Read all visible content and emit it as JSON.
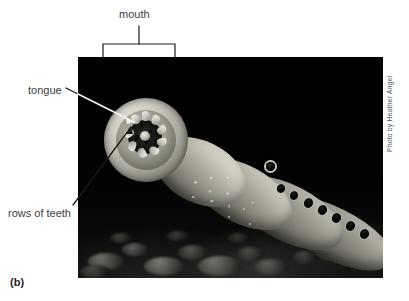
{
  "figure": {
    "letter": "(b)",
    "photo_credit": "Photo by Heather Angel"
  },
  "labels": {
    "mouth": "mouth",
    "tongue": "tongue",
    "rows_of_teeth": "rows of teeth"
  },
  "callouts": [
    {
      "name": "mouth",
      "text": "mouth",
      "style": "bracket",
      "bracket_left_x": 103,
      "bracket_right_x": 175,
      "bracket_top_y": 44,
      "bracket_bottom_y": 57,
      "stem_x": 139,
      "stem_top_y": 26,
      "text_x": 139,
      "text_y": 14
    },
    {
      "name": "tongue",
      "text": "tongue",
      "style": "leader-line",
      "text_x": 28,
      "text_y": 90,
      "line_from": [
        66,
        88
      ],
      "line_to": [
        134,
        122
      ]
    },
    {
      "name": "rows-of-teeth",
      "text": "rows of teeth",
      "style": "leader-line",
      "text_x": 8,
      "text_y": 213,
      "line_from": [
        73,
        205
      ],
      "line_to": [
        131,
        127
      ]
    }
  ],
  "photo": {
    "x": 78,
    "y": 57,
    "width": 305,
    "height": 221,
    "background_color": "#050505",
    "description": "Black-background underwater photograph of a sea lamprey. The round sucker-like oral disc faces the viewer at upper left; the tapering body extends diagonally toward the lower right with a row of seven round gill slits and one eye.",
    "gill_slit_count": 7
  },
  "colors": {
    "page_background": "#ffffff",
    "label_text": "#3c3c3e",
    "figure_letter_text": "#1e1e20",
    "credit_text": "#58585a",
    "line_black": "#1a1a1a",
    "line_white": "#f2f2f0",
    "photo_black": "#050505"
  }
}
